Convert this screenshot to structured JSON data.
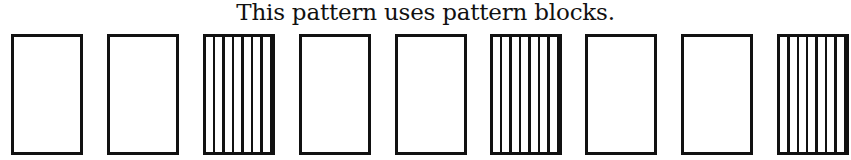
{
  "title": "This pattern uses pattern blocks.",
  "pattern": {
    "blocks": [
      {
        "type": "plain",
        "left": 11
      },
      {
        "type": "plain",
        "left": 107
      },
      {
        "type": "striped",
        "left": 203
      },
      {
        "type": "plain",
        "left": 299
      },
      {
        "type": "plain",
        "left": 395
      },
      {
        "type": "striped",
        "left": 490
      },
      {
        "type": "plain",
        "left": 585
      },
      {
        "type": "plain",
        "left": 681
      },
      {
        "type": "striped",
        "left": 777
      }
    ],
    "repeat_unit": [
      "plain",
      "plain",
      "striped"
    ],
    "colors": {
      "stroke": "#111111",
      "fill": "#ffffff"
    }
  }
}
